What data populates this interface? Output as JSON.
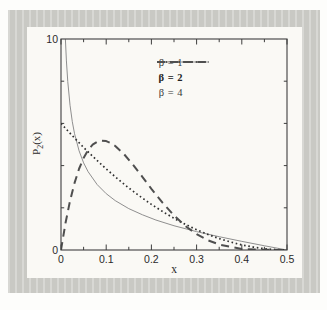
{
  "figure": {
    "x_axis_label": "x",
    "y_axis_label_base": "P",
    "y_axis_label_sub": "2",
    "y_axis_label_rest": "(x)"
  },
  "legend": {
    "items": [
      {
        "label": "β = 1",
        "style": "solid"
      },
      {
        "label": "β = 2",
        "style": "dotted"
      },
      {
        "label": "β = 4",
        "style": "long-dash"
      }
    ]
  },
  "colors": {
    "mat_gray": "#c9c9c4",
    "panel": "#faf9f5",
    "frame": "#3e3e3e",
    "curve_beta1": "#8f8f8f",
    "curve_beta2": "#2f2f2f",
    "curve_beta4": "#4f4f4f"
  },
  "chart_data": {
    "type": "line",
    "title": "",
    "xlabel": "x",
    "ylabel": "P2(x)",
    "xlim": [
      0,
      0.5
    ],
    "ylim": [
      0,
      10
    ],
    "grid": false,
    "legend_position": "top-right",
    "x_ticks_major": [
      0,
      0.1,
      0.2,
      0.3,
      0.4,
      0.5
    ],
    "x_tick_labels": [
      "0",
      "0.1",
      "0.2",
      "0.3",
      "0.4",
      "0.5"
    ],
    "x_ticks_minor": [
      0.05,
      0.15,
      0.25,
      0.35,
      0.45
    ],
    "y_tick_labels": [
      {
        "value": 0,
        "label": "0"
      },
      {
        "value": 10,
        "label": "10"
      }
    ],
    "y_ticks_minor": [
      2,
      4,
      6,
      8
    ],
    "series": [
      {
        "name": "β = 1",
        "style": "solid",
        "x": [
          0.0097,
          0.012,
          0.015,
          0.02,
          0.025,
          0.03,
          0.04,
          0.05,
          0.06,
          0.08,
          0.1,
          0.12,
          0.15,
          0.18,
          0.21,
          0.25,
          0.3,
          0.35,
          0.4,
          0.45,
          0.48,
          0.5
        ],
        "y": [
          10,
          8.96,
          7.98,
          6.86,
          6.08,
          5.51,
          4.7,
          4.13,
          3.71,
          3.1,
          2.67,
          2.34,
          1.96,
          1.67,
          1.42,
          1.15,
          0.87,
          0.63,
          0.41,
          0.2,
          0.08,
          0
        ]
      },
      {
        "name": "β = 2",
        "style": "dotted",
        "x": [
          0,
          0.025,
          0.05,
          0.075,
          0.1,
          0.125,
          0.15,
          0.175,
          0.2,
          0.225,
          0.25,
          0.275,
          0.3,
          0.325,
          0.35,
          0.375,
          0.4,
          0.425,
          0.45,
          0.475,
          0.5
        ],
        "y": [
          6.0,
          5.42,
          4.86,
          4.34,
          3.84,
          3.38,
          2.94,
          2.54,
          2.16,
          1.82,
          1.5,
          1.22,
          0.96,
          0.74,
          0.54,
          0.38,
          0.24,
          0.14,
          0.06,
          0.02,
          0
        ]
      },
      {
        "name": "β = 4",
        "style": "long-dash",
        "x": [
          0,
          0.01,
          0.02,
          0.03,
          0.04,
          0.05,
          0.06,
          0.07,
          0.08,
          0.09,
          0.1,
          0.11,
          0.12,
          0.14,
          0.16,
          0.18,
          0.2,
          0.225,
          0.25,
          0.275,
          0.3,
          0.325,
          0.35,
          0.4,
          0.45,
          0.5
        ],
        "y": [
          0,
          1.28,
          2.33,
          3.18,
          3.85,
          4.36,
          4.74,
          4.99,
          5.13,
          5.18,
          5.16,
          5.07,
          4.93,
          4.53,
          4.02,
          3.47,
          2.9,
          2.23,
          1.64,
          1.14,
          0.75,
          0.46,
          0.26,
          0.05,
          0.01,
          0
        ]
      }
    ]
  }
}
